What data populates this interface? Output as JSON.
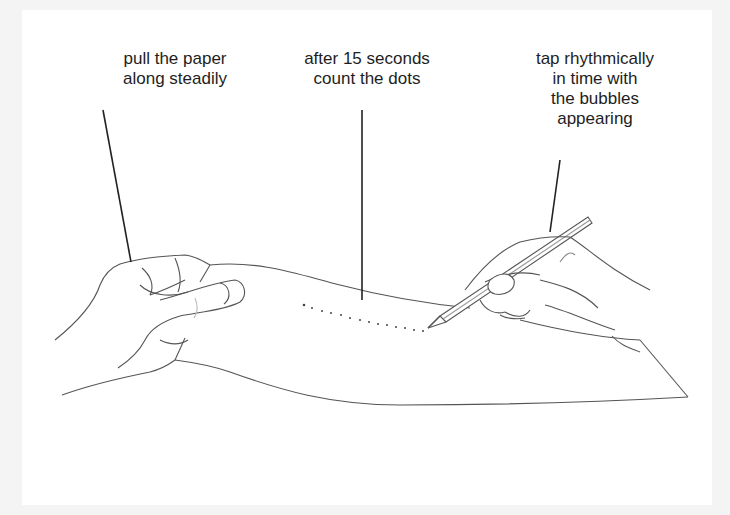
{
  "figure": {
    "type": "instructional-illustration",
    "background_color": "#f4f4f4",
    "panel_color": "#ffffff",
    "line_color": "#444444"
  },
  "annotations": {
    "pull": {
      "lines": [
        "pull the paper",
        "along steadily"
      ]
    },
    "count": {
      "lines": [
        "after 15 seconds",
        "count the dots"
      ]
    },
    "tap": {
      "lines": [
        "tap rhythmically",
        "in time with",
        "the bubbles",
        "appearing"
      ]
    }
  },
  "dots": {
    "count_visible": 14
  }
}
